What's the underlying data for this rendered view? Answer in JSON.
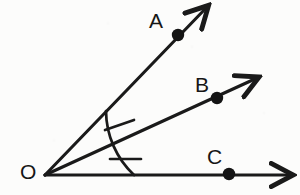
{
  "figure": {
    "background_color": "#fcfcfb",
    "stroke_color": "#1a1a1a",
    "label_color": "#161616",
    "vertex": {
      "name": "O",
      "label": "O",
      "x": 45,
      "y": 175,
      "label_x": 20,
      "label_y": 163
    },
    "rays": [
      {
        "id": "ray-oa",
        "label": "A",
        "from_x": 45,
        "from_y": 175,
        "to_x": 211,
        "to_y": 3,
        "angle_degrees": 46,
        "point": {
          "label": "A",
          "x": 178,
          "y": 35,
          "label_x": 149,
          "label_y": 11
        }
      },
      {
        "id": "ray-ob",
        "label": "B",
        "from_x": 45,
        "from_y": 175,
        "to_x": 262,
        "to_y": 76,
        "angle_degrees": 24,
        "point": {
          "label": "B",
          "x": 217,
          "y": 98,
          "label_x": 195,
          "label_y": 75
        }
      },
      {
        "id": "ray-oc",
        "label": "C",
        "from_x": 45,
        "from_y": 175,
        "to_x": 296,
        "to_y": 175,
        "angle_degrees": 0,
        "point": {
          "label": "C",
          "x": 229,
          "y": 174,
          "label_x": 207,
          "label_y": 146
        }
      }
    ],
    "arc": {
      "id": "congruence-arc",
      "center_x": 45,
      "center_y": 175,
      "radius": 89,
      "start_x": 106,
      "start_y": 111,
      "end_x": 134,
      "end_y": 175
    },
    "tick_marks": [
      {
        "id": "tick-angle-aob",
        "marks": 1,
        "angle_label": "angle AOB",
        "x1": 106,
        "y1": 129,
        "x2": 133,
        "y2": 121
      },
      {
        "id": "tick-angle-boc",
        "marks": 1,
        "angle_label": "angle BOC",
        "x1": 111,
        "y1": 159,
        "x2": 140,
        "y2": 159
      }
    ],
    "arrowheads": [
      {
        "id": "arrowhead-a",
        "x": 211,
        "y": 3
      },
      {
        "id": "arrowhead-b",
        "x": 262,
        "y": 76
      },
      {
        "id": "arrowhead-c",
        "x": 296,
        "y": 175
      }
    ]
  }
}
